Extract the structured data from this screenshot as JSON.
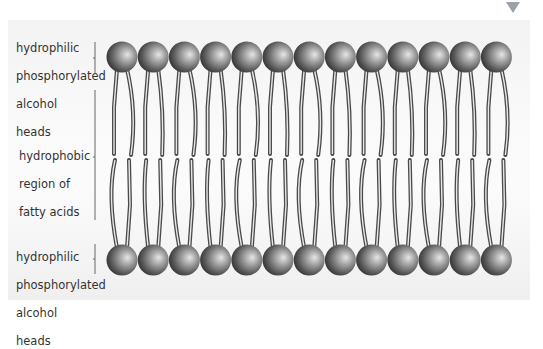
{
  "diagram": {
    "labels": {
      "top_heads": [
        "hydrophilic",
        "phosphorylated",
        "alcohol",
        "heads"
      ],
      "middle": [
        "hydrophobic",
        "region of",
        "fatty acids"
      ],
      "bottom_heads": [
        "hydrophilic",
        "phosphorylated",
        "alcohol",
        "heads"
      ]
    },
    "heads_per_row": 13,
    "colors": {
      "head_light": "#e0e0e0",
      "head_dark": "#4a4a4a",
      "tail_stroke": "#555555",
      "panel": "#f5f5f5",
      "marker": "#9aa1a8"
    },
    "marker_icon": "down-triangle-icon"
  }
}
